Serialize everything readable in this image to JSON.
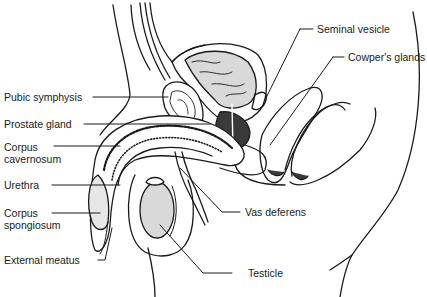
{
  "diagram": {
    "labels": {
      "seminal_vesicle": "Seminal vesicle",
      "cowpers_glands": "Cowper's glands",
      "pubic_symphysis": "Pubic symphysis",
      "prostate_gland": "Prostate gland",
      "corpus_cavernosum_1": "Corpus",
      "corpus_cavernosum_2": "cavernosum",
      "urethra": "Urethra",
      "corpus_spongiosum_1": "Corpus",
      "corpus_spongiosum_2": "spongiosum",
      "external_meatus": "External meatus",
      "vas_deferens": "Vas deferens",
      "testicle": "Testicle"
    },
    "colors": {
      "line": "#1a1a1a",
      "shade": "#d9d9d9",
      "dark_tissue": "#3a3a3a",
      "background": "#ffffff"
    }
  }
}
